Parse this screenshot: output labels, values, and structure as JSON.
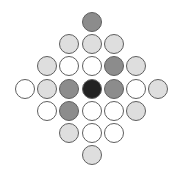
{
  "diagram": {
    "type": "diamond-circle-grid",
    "spacing_px": 22.2,
    "origin": {
      "x": 25,
      "y": 22
    },
    "center_col": 3,
    "palette": {
      "black": "#232323",
      "medium": "#8c8c8c",
      "light": "#dedede",
      "white": "#ffffff",
      "border": "#5f5f5f"
    },
    "rows": [
      {
        "row": 0,
        "cells": [
          {
            "col": 3,
            "fill": "medium"
          }
        ]
      },
      {
        "row": 1,
        "cells": [
          {
            "col": 2,
            "fill": "light"
          },
          {
            "col": 3,
            "fill": "light"
          },
          {
            "col": 4,
            "fill": "light"
          }
        ]
      },
      {
        "row": 2,
        "cells": [
          {
            "col": 1,
            "fill": "light"
          },
          {
            "col": 2,
            "fill": "white"
          },
          {
            "col": 3,
            "fill": "white"
          },
          {
            "col": 4,
            "fill": "medium"
          },
          {
            "col": 5,
            "fill": "light"
          }
        ]
      },
      {
        "row": 3,
        "cells": [
          {
            "col": 0,
            "fill": "white"
          },
          {
            "col": 1,
            "fill": "light"
          },
          {
            "col": 2,
            "fill": "medium"
          },
          {
            "col": 3,
            "fill": "black"
          },
          {
            "col": 4,
            "fill": "medium"
          },
          {
            "col": 5,
            "fill": "white"
          },
          {
            "col": 6,
            "fill": "light"
          }
        ]
      },
      {
        "row": 4,
        "cells": [
          {
            "col": 1,
            "fill": "white"
          },
          {
            "col": 2,
            "fill": "medium"
          },
          {
            "col": 3,
            "fill": "white"
          },
          {
            "col": 4,
            "fill": "white"
          },
          {
            "col": 5,
            "fill": "light"
          }
        ]
      },
      {
        "row": 5,
        "cells": [
          {
            "col": 2,
            "fill": "light"
          },
          {
            "col": 3,
            "fill": "white"
          },
          {
            "col": 4,
            "fill": "white"
          }
        ]
      },
      {
        "row": 6,
        "cells": [
          {
            "col": 3,
            "fill": "light"
          }
        ]
      }
    ]
  }
}
